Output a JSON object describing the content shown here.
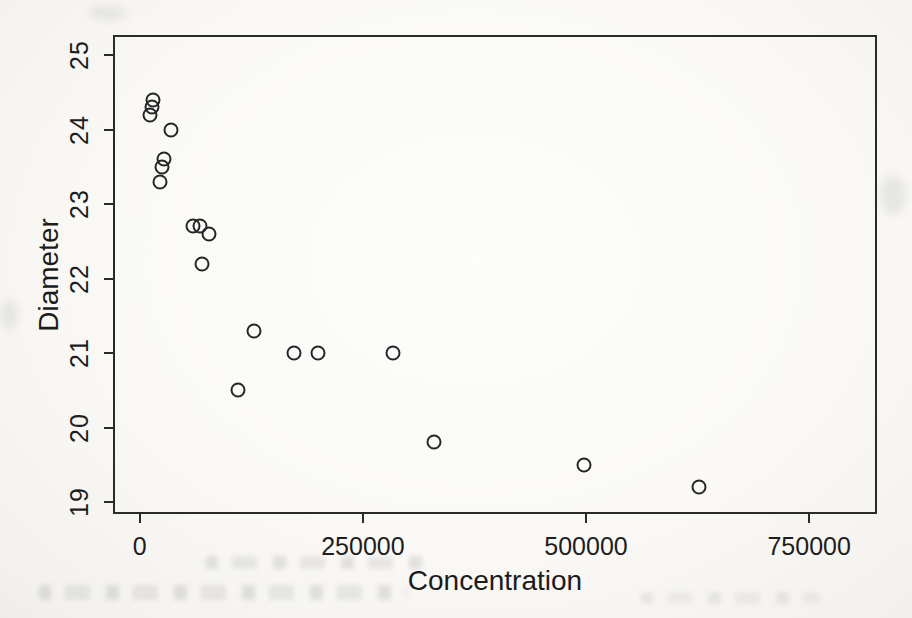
{
  "figure": {
    "kind": "scanned-book-scatterplot"
  },
  "chart_data": {
    "type": "scatter",
    "title": "",
    "xlabel": "Concentration",
    "ylabel": "Diameter",
    "xlim": [
      -30000,
      826000
    ],
    "ylim": [
      18.84,
      25.27
    ],
    "grid": false,
    "legend": null,
    "marker": "open-circle",
    "x_ticks": {
      "values": [
        0,
        250000,
        500000,
        750000
      ],
      "labels": [
        "0",
        "250000",
        "500000",
        "750000"
      ]
    },
    "y_ticks": {
      "values": [
        19,
        20,
        21,
        22,
        23,
        24,
        25
      ],
      "labels": [
        "19",
        "20",
        "21",
        "22",
        "23",
        "24",
        "25"
      ]
    },
    "points": [
      {
        "x": 12000,
        "y": 24.2
      },
      {
        "x": 13500,
        "y": 24.3
      },
      {
        "x": 14500,
        "y": 24.4
      },
      {
        "x": 22500,
        "y": 23.3
      },
      {
        "x": 24500,
        "y": 23.5
      },
      {
        "x": 27000,
        "y": 23.6
      },
      {
        "x": 35000,
        "y": 24.0
      },
      {
        "x": 60000,
        "y": 22.7
      },
      {
        "x": 68000,
        "y": 22.7
      },
      {
        "x": 70000,
        "y": 22.2
      },
      {
        "x": 77000,
        "y": 22.6
      },
      {
        "x": 110000,
        "y": 20.5
      },
      {
        "x": 128000,
        "y": 21.3
      },
      {
        "x": 173000,
        "y": 21.0
      },
      {
        "x": 200000,
        "y": 21.0
      },
      {
        "x": 284000,
        "y": 21.0
      },
      {
        "x": 330000,
        "y": 19.8
      },
      {
        "x": 498000,
        "y": 19.5
      },
      {
        "x": 627000,
        "y": 19.2
      }
    ],
    "colors": {
      "axis": "#2a2a2a",
      "marker_stroke": "#262626",
      "text": "#1d1d1d",
      "page_background": "#f6f5f1"
    }
  }
}
